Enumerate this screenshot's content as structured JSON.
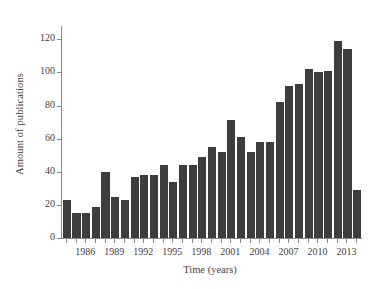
{
  "chart_data": {
    "type": "bar",
    "title": "",
    "xlabel": "Time (years)",
    "ylabel": "Amount of publications",
    "categories": [
      1984,
      1985,
      1986,
      1987,
      1988,
      1989,
      1990,
      1991,
      1992,
      1993,
      1994,
      1995,
      1996,
      1997,
      1998,
      1999,
      2000,
      2001,
      2002,
      2003,
      2004,
      2005,
      2006,
      2007,
      2008,
      2009,
      2010,
      2011,
      2012,
      2013,
      2014
    ],
    "values": [
      23,
      15,
      15,
      19,
      40,
      25,
      23,
      37,
      38,
      38,
      44,
      34,
      44,
      44,
      49,
      55,
      52,
      71,
      61,
      52,
      58,
      58,
      82,
      92,
      93,
      102,
      100,
      101,
      119,
      114,
      29
    ],
    "ylim": [
      0,
      128
    ],
    "xlim": [
      1983.5,
      2014.5
    ],
    "ytick_values": [
      0,
      20,
      40,
      60,
      80,
      100,
      120
    ],
    "ytick_labels": [
      "0",
      "20",
      "40",
      "60",
      "80",
      "100",
      "120"
    ],
    "xtick_values": [
      1986,
      1989,
      1992,
      1995,
      1998,
      2001,
      2004,
      2007,
      2010,
      2013
    ],
    "xtick_labels": [
      "1986",
      "1989",
      "1992",
      "1995",
      "1998",
      "2001",
      "2004",
      "2007",
      "2010",
      "2013"
    ],
    "grid": false,
    "legend": false,
    "bar_color": "#3d3d3d",
    "axis_color": "#8a8a8a",
    "text_color": "#3f3f3f",
    "background_color": "#ffffff"
  }
}
